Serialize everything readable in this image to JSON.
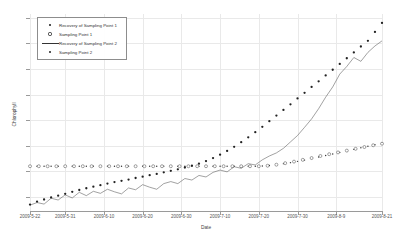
{
  "chart_data": {
    "type": "line",
    "title": "",
    "xlabel": "Date",
    "ylabel": "Chlorophyll",
    "ylim": [
      4.45,
      12.15
    ],
    "yticks": [
      5,
      6,
      7,
      8,
      9,
      10,
      11,
      12
    ],
    "ytick_labels": [
      "5",
      "6",
      "7",
      "8",
      "9",
      "10",
      "11",
      "12"
    ],
    "grid": true,
    "legend_position": "upper-left",
    "xtick_labels": [
      "2009-5-22",
      "2009-5-31",
      "2009-6-10",
      "2009-6-20",
      "2009-6-30",
      "2009-7-10",
      "2009-7-20",
      "2009-7-30",
      "2009-8-9",
      "2009-8-21"
    ],
    "xtick_positions": [
      0.0,
      0.1,
      0.21,
      0.32,
      0.43,
      0.54,
      0.65,
      0.76,
      0.87,
      1.0
    ],
    "series": [
      {
        "name": "Recovery of Sampling Point 1",
        "marker": "small-dot",
        "color": "#333333",
        "x": [
          0.0,
          0.02,
          0.04,
          0.06,
          0.08,
          0.1,
          0.12,
          0.14,
          0.16,
          0.18,
          0.2,
          0.22,
          0.24,
          0.26,
          0.28,
          0.3,
          0.32,
          0.34,
          0.36,
          0.38,
          0.4,
          0.42,
          0.44,
          0.46,
          0.48,
          0.5,
          0.52,
          0.54,
          0.56,
          0.58,
          0.6,
          0.62,
          0.64,
          0.66,
          0.68,
          0.7,
          0.72,
          0.74,
          0.76,
          0.78,
          0.8,
          0.82,
          0.84,
          0.86,
          0.88,
          0.9,
          0.92,
          0.94,
          0.96,
          0.98,
          1.0
        ],
        "y": [
          6.2,
          6.2,
          6.2,
          6.2,
          6.2,
          6.2,
          6.2,
          6.2,
          6.2,
          6.2,
          6.2,
          6.2,
          6.2,
          6.2,
          6.2,
          6.2,
          6.2,
          6.2,
          6.2,
          6.2,
          6.2,
          6.2,
          6.2,
          6.2,
          6.2,
          6.2,
          6.2,
          6.2,
          6.2,
          6.2,
          6.2,
          6.2,
          6.2,
          6.21,
          6.23,
          6.26,
          6.3,
          6.34,
          6.39,
          6.44,
          6.5,
          6.56,
          6.62,
          6.68,
          6.74,
          6.8,
          6.86,
          6.92,
          6.98,
          7.04,
          7.1
        ]
      },
      {
        "name": "Sampling Point 1",
        "marker": "open-circle",
        "color": "#444444",
        "x": [
          0.0,
          0.025,
          0.05,
          0.075,
          0.1,
          0.125,
          0.15,
          0.175,
          0.2,
          0.225,
          0.25,
          0.275,
          0.3,
          0.325,
          0.35,
          0.375,
          0.4,
          0.425,
          0.45,
          0.475,
          0.5,
          0.525,
          0.55,
          0.575,
          0.6,
          0.625,
          0.65,
          0.675,
          0.7,
          0.725,
          0.75,
          0.775,
          0.8,
          0.825,
          0.85,
          0.875,
          0.9,
          0.925,
          0.95,
          0.975,
          1.0
        ],
        "y": [
          6.2,
          6.2,
          6.2,
          6.2,
          6.2,
          6.2,
          6.2,
          6.2,
          6.2,
          6.2,
          6.2,
          6.2,
          6.2,
          6.2,
          6.2,
          6.2,
          6.2,
          6.2,
          6.2,
          6.2,
          6.2,
          6.2,
          6.2,
          6.2,
          6.2,
          6.2,
          6.2,
          6.22,
          6.26,
          6.32,
          6.38,
          6.45,
          6.52,
          6.6,
          6.67,
          6.74,
          6.81,
          6.88,
          6.95,
          7.02,
          7.08
        ]
      },
      {
        "name": "Recovery of Sampling Point 2",
        "marker": "line",
        "color": "#555555",
        "x": [
          0.0,
          0.02,
          0.04,
          0.06,
          0.08,
          0.1,
          0.12,
          0.14,
          0.16,
          0.18,
          0.2,
          0.22,
          0.24,
          0.26,
          0.28,
          0.3,
          0.32,
          0.34,
          0.36,
          0.38,
          0.4,
          0.42,
          0.44,
          0.46,
          0.48,
          0.5,
          0.52,
          0.54,
          0.56,
          0.58,
          0.6,
          0.62,
          0.64,
          0.66,
          0.68,
          0.7,
          0.72,
          0.74,
          0.76,
          0.78,
          0.8,
          0.82,
          0.84,
          0.86,
          0.88,
          0.9,
          0.92,
          0.94,
          0.96,
          0.98,
          1.0
        ],
        "y": [
          4.68,
          4.78,
          4.72,
          4.95,
          4.88,
          5.08,
          4.96,
          5.18,
          5.05,
          5.22,
          5.14,
          5.3,
          5.2,
          5.12,
          5.35,
          5.28,
          5.48,
          5.38,
          5.3,
          5.52,
          5.6,
          5.52,
          5.72,
          5.66,
          5.84,
          5.78,
          5.96,
          6.05,
          5.98,
          6.18,
          6.12,
          6.3,
          6.25,
          6.45,
          6.6,
          6.72,
          6.9,
          7.15,
          7.4,
          7.72,
          8.05,
          8.45,
          8.9,
          9.3,
          9.8,
          10.1,
          10.45,
          10.3,
          10.65,
          10.9,
          11.1
        ]
      },
      {
        "name": "Sampling Point 2",
        "marker": "filled-dot",
        "color": "#222222",
        "x": [
          0.0,
          0.02,
          0.04,
          0.06,
          0.08,
          0.1,
          0.12,
          0.14,
          0.16,
          0.18,
          0.2,
          0.22,
          0.24,
          0.26,
          0.28,
          0.3,
          0.32,
          0.34,
          0.36,
          0.38,
          0.4,
          0.42,
          0.44,
          0.46,
          0.48,
          0.5,
          0.52,
          0.54,
          0.56,
          0.58,
          0.6,
          0.62,
          0.64,
          0.66,
          0.68,
          0.7,
          0.72,
          0.74,
          0.76,
          0.78,
          0.8,
          0.82,
          0.84,
          0.86,
          0.88,
          0.9,
          0.92,
          0.94,
          0.96,
          0.98,
          1.0
        ],
        "y": [
          4.7,
          4.82,
          4.9,
          4.98,
          5.05,
          5.12,
          5.2,
          5.27,
          5.34,
          5.4,
          5.46,
          5.52,
          5.58,
          5.63,
          5.68,
          5.74,
          5.79,
          5.85,
          5.9,
          5.96,
          6.02,
          6.08,
          6.15,
          6.22,
          6.3,
          6.4,
          6.52,
          6.65,
          6.8,
          6.96,
          7.14,
          7.33,
          7.53,
          7.74,
          7.96,
          8.18,
          8.4,
          8.62,
          8.85,
          9.07,
          9.3,
          9.52,
          9.75,
          9.97,
          10.2,
          10.42,
          10.65,
          10.88,
          11.1,
          11.45,
          11.8
        ]
      }
    ],
    "legend_entries": [
      {
        "label": "Recovery of Sampling Point 1",
        "key": "small-dot"
      },
      {
        "label": "Sampling Point 1",
        "key": "open-circle"
      },
      {
        "label": "Recovery of Sampling Point 2",
        "key": "line"
      },
      {
        "label": "Sampling Point 2",
        "key": "filled-dot"
      }
    ]
  }
}
